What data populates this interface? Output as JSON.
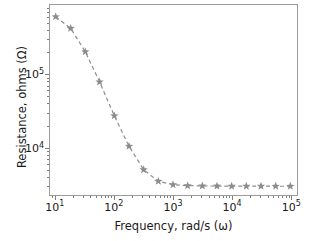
{
  "chart_data": {
    "type": "line",
    "title": "",
    "xlabel": "Frequency, rad/s (ω)",
    "ylabel": "Resistance, ohms (Ω)",
    "xscale": "log",
    "yscale": "log",
    "xlim": [
      8.0,
      130000.0
    ],
    "ylim": [
      2200.0,
      900000.0
    ],
    "grid": false,
    "legend": null,
    "marker": "star",
    "linestyle": "dashed",
    "color": "#8c8c8c",
    "x": [
      10,
      18,
      32,
      56,
      100,
      178,
      316,
      562,
      1000,
      1778,
      3162,
      5623,
      10000,
      17783,
      31623,
      56234,
      100000
    ],
    "y": [
      620000,
      430000,
      205000,
      79000,
      27000,
      10300,
      4900,
      3400,
      3050,
      2960,
      2930,
      2920,
      2915,
      2910,
      2910,
      2905,
      2905
    ],
    "xticks": [
      {
        "value": 10,
        "label": "10",
        "exp": "1"
      },
      {
        "value": 100,
        "label": "10",
        "exp": "2"
      },
      {
        "value": 1000,
        "label": "10",
        "exp": "3"
      },
      {
        "value": 10000,
        "label": "10",
        "exp": "4"
      },
      {
        "value": 100000,
        "label": "10",
        "exp": "5"
      }
    ],
    "yticks": [
      {
        "value": 10000,
        "label": "10",
        "exp": "4"
      },
      {
        "value": 100000,
        "label": "10",
        "exp": "5"
      }
    ]
  },
  "axis": {
    "x_title": "Frequency, rad/s (ω)",
    "y_title": "Resistance, ohms (Ω)"
  },
  "style": {
    "series_color": "#8c8c8c",
    "frame_color": "#9a9a9a",
    "tick_color": "#7d7d7d",
    "text_color": "#1a1a1a",
    "background": "#ffffff"
  }
}
